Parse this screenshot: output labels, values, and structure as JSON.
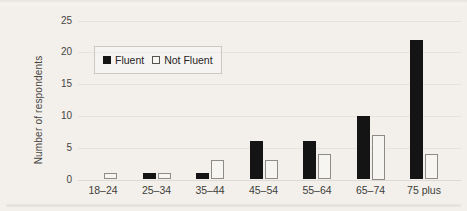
{
  "figure": {
    "background_color": "#f3f0ec",
    "text_color": "#403e39",
    "gridline_color": "#e6e3df",
    "bar_black": "#141414",
    "bar_white_fill": "#f7f5f2",
    "bar_white_border": "#8e8c88"
  },
  "chart_data": {
    "type": "bar",
    "title": "",
    "xlabel": "",
    "ylabel": "Number of respondents",
    "categories": [
      "18–24",
      "25–34",
      "35–44",
      "45–54",
      "55–64",
      "65–74",
      "75 plus"
    ],
    "series": [
      {
        "name": "Fluent",
        "color": "#141414",
        "values": [
          0,
          1,
          1,
          6,
          6,
          10,
          22
        ]
      },
      {
        "name": "Not Fluent",
        "color": "#f7f5f2",
        "border_color": "#8e8c88",
        "values": [
          1,
          1,
          3,
          3,
          4,
          7,
          4
        ]
      }
    ],
    "ylim": [
      0,
      25
    ],
    "yticks": [
      0,
      5,
      10,
      15,
      20,
      25
    ],
    "grid": true,
    "legend_position": "inside-upper-left"
  }
}
